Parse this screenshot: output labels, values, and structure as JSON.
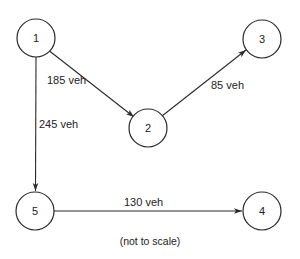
{
  "diagram": {
    "type": "directed-network",
    "nodes": [
      {
        "id": "1",
        "label": "1",
        "cx": 36,
        "cy": 38
      },
      {
        "id": "2",
        "label": "2",
        "cx": 148,
        "cy": 128
      },
      {
        "id": "3",
        "label": "3",
        "cx": 262,
        "cy": 39
      },
      {
        "id": "4",
        "label": "4",
        "cx": 262,
        "cy": 211
      },
      {
        "id": "5",
        "label": "5",
        "cx": 35,
        "cy": 211
      }
    ],
    "node_radius": 19,
    "edges": [
      {
        "from": "1",
        "to": "2",
        "label": "185 veh"
      },
      {
        "from": "2",
        "to": "3",
        "label": "85 veh"
      },
      {
        "from": "1",
        "to": "5",
        "label": "245 veh"
      },
      {
        "from": "5",
        "to": "4",
        "label": "130 veh"
      }
    ],
    "caption": "(not to scale)"
  }
}
